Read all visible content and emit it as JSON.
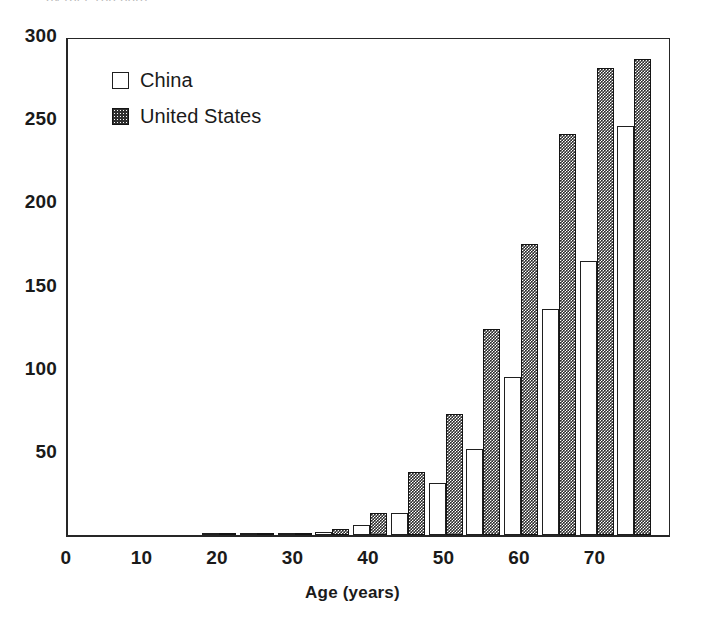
{
  "figure": {
    "clipped_title_fragment": "... by (per 100,000)",
    "background_color": "#ffffff",
    "ink_color": "#1f1f1f"
  },
  "legend": {
    "position": "inside-upper-left",
    "entries": [
      {
        "label": "China",
        "swatch": "legend-swatch-china",
        "color": "#ffffff",
        "pattern": "open"
      },
      {
        "label": "United States",
        "swatch": "legend-swatch-united-states",
        "color": "#2f2f2f",
        "pattern": "checkered"
      }
    ]
  },
  "axes": {
    "x": {
      "title": "Age (years)",
      "ticks": [
        "0",
        "10",
        "20",
        "30",
        "40",
        "50",
        "60",
        "70"
      ],
      "tick_values": [
        0,
        10,
        20,
        30,
        40,
        50,
        60,
        70
      ],
      "range": [
        0,
        80
      ]
    },
    "y": {
      "title": "",
      "ticks": [
        "50",
        "100",
        "150",
        "200",
        "250",
        "300"
      ],
      "tick_values": [
        50,
        100,
        150,
        200,
        250,
        300
      ],
      "range": [
        0,
        300
      ]
    }
  },
  "chart_data": {
    "type": "bar",
    "title": "",
    "subtitle": "",
    "xlabel": "Age (years)",
    "ylabel": "",
    "xlim": [
      0,
      80
    ],
    "ylim": [
      0,
      300
    ],
    "grid": false,
    "legend_position": "upper left",
    "categories": [
      "20",
      "25",
      "30",
      "35",
      "40",
      "45",
      "50",
      "55",
      "60",
      "65",
      "70",
      "75"
    ],
    "series": [
      {
        "name": "China",
        "color": "#ffffff",
        "values": [
          0.5,
          0.5,
          1,
          2,
          6,
          13,
          31,
          52,
          95,
          136,
          165,
          246
        ]
      },
      {
        "name": "United States",
        "color": "#2f2f2f",
        "values": [
          1,
          1,
          1.5,
          3.5,
          13,
          38,
          73,
          124,
          175,
          241,
          281,
          286
        ]
      }
    ]
  }
}
